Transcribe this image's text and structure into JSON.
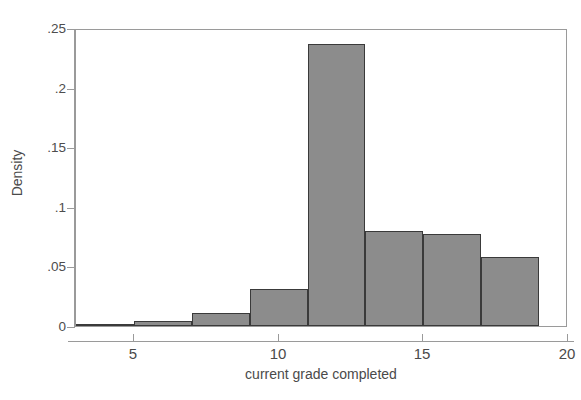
{
  "chart_data": {
    "type": "bar",
    "title": "",
    "subtitle": "",
    "xlabel": "current grade completed",
    "ylabel": "Density",
    "xlim": [
      3,
      20
    ],
    "ylim": [
      0,
      0.25
    ],
    "grid": false,
    "legend": null,
    "bin_width": 2,
    "bin_edges": [
      3,
      5,
      7,
      9,
      11,
      13,
      15,
      17,
      19
    ],
    "categories": [
      "3-5",
      "5-7",
      "7-9",
      "9-11",
      "11-13",
      "13-15",
      "15-17",
      "17-19"
    ],
    "values": [
      0.001,
      0.004,
      0.011,
      0.031,
      0.237,
      0.08,
      0.077,
      0.058
    ],
    "bars": [
      {
        "x0": 3,
        "x1": 5,
        "value": 0.001
      },
      {
        "x0": 5,
        "x1": 7,
        "value": 0.004
      },
      {
        "x0": 7,
        "x1": 9,
        "value": 0.011
      },
      {
        "x0": 9,
        "x1": 11,
        "value": 0.031
      },
      {
        "x0": 11,
        "x1": 13,
        "value": 0.237
      },
      {
        "x0": 13,
        "x1": 15,
        "value": 0.08
      },
      {
        "x0": 15,
        "x1": 17,
        "value": 0.077
      },
      {
        "x0": 17,
        "x1": 19,
        "value": 0.058
      }
    ],
    "xticks": [
      5,
      10,
      15,
      20
    ],
    "xtick_labels": [
      "5",
      "10",
      "15",
      "20"
    ],
    "yticks": [
      0,
      0.05,
      0.1,
      0.15,
      0.2,
      0.25
    ],
    "ytick_labels": [
      "0",
      ".05",
      ".1",
      ".15",
      ".2",
      ".25"
    ],
    "colors": {
      "bar_fill": "#8c8c8c",
      "bar_edge": "#3a3a3a",
      "axis": "#9a9a9a",
      "text": "#4a4a4a",
      "background": "#ffffff"
    }
  }
}
